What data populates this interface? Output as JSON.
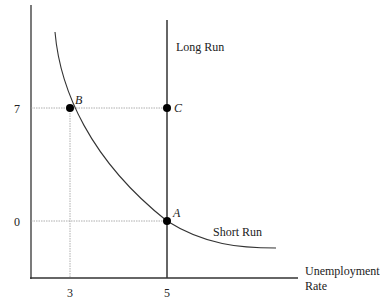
{
  "diagram": {
    "type": "phillips-curve",
    "y_ticks": [
      {
        "label": "7"
      },
      {
        "label": "0"
      }
    ],
    "x_ticks": [
      {
        "label": "3"
      },
      {
        "label": "5"
      }
    ],
    "x_axis_label_line1": "Unemployment",
    "x_axis_label_line2": "Rate",
    "long_run_label": "Long Run",
    "short_run_label": "Short Run",
    "points": [
      {
        "name": "B",
        "label": "B",
        "x": 3,
        "y": 7
      },
      {
        "name": "C",
        "label": "C",
        "x": 5,
        "y": 7
      },
      {
        "name": "A",
        "label": "A",
        "x": 5,
        "y": 0
      }
    ],
    "colors": {
      "line": "#333333",
      "guide": "#999999",
      "point": "#000000"
    }
  }
}
